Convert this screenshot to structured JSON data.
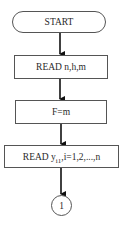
{
  "diagram": {
    "type": "flowchart",
    "nodes": [
      {
        "id": "start",
        "shape": "terminator",
        "label": "START"
      },
      {
        "id": "read1",
        "shape": "process",
        "label": "READ n,h,m"
      },
      {
        "id": "assign",
        "shape": "process",
        "label": "F=m"
      },
      {
        "id": "read2",
        "shape": "process",
        "label_main": "READ y",
        "label_sub": "i1",
        "label_rest": ",i=1,2,...,n"
      },
      {
        "id": "conn1",
        "shape": "connector",
        "label": "1"
      }
    ],
    "edges": [
      {
        "from": "start",
        "to": "read1"
      },
      {
        "from": "read1",
        "to": "assign"
      },
      {
        "from": "assign",
        "to": "read2"
      },
      {
        "from": "read2",
        "to": "conn1"
      }
    ],
    "colors": {
      "stroke": "#555555",
      "text": "#2a2a2a",
      "arrow": "#111111"
    }
  }
}
